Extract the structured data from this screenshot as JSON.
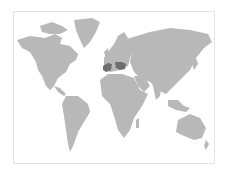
{
  "map": {
    "type": "world-choropleth",
    "land_color": "#b8b8b8",
    "highlight_color": "#6e6e6e",
    "background_color": "#ffffff",
    "border_color": "#e4e4e4",
    "highlighted_regions": [
      "Spain",
      "Hungary/Balkans region"
    ]
  }
}
